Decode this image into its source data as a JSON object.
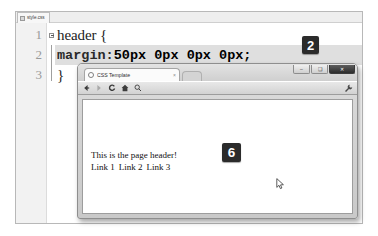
{
  "editor": {
    "tab": {
      "label": "style.css",
      "icon": "document-icon"
    },
    "gutter_line_numbers": [
      "1",
      "2",
      "3"
    ],
    "code": {
      "line1": "header {",
      "line2_property": "margin:",
      "line2_value": "50px 0px 0px 0px;",
      "line3": "}"
    }
  },
  "callouts": [
    {
      "id": "badge-2",
      "label": "2"
    },
    {
      "id": "badge-6",
      "label": "6"
    }
  ],
  "browser": {
    "tab": {
      "title": "CSS Template",
      "favicon": "globe-icon",
      "close": "×"
    },
    "new_tab_label": "",
    "window_controls": {
      "minimize": "–",
      "maximize": "❑",
      "close": "✕"
    },
    "toolbar": {
      "back": "back-arrow-icon",
      "forward": "forward-arrow-icon",
      "reload": "C",
      "home": "home-icon",
      "search": "search-icon",
      "menu": "wrench-icon"
    },
    "page": {
      "header_text": "This is the page header!",
      "links": [
        "Link 1",
        "Link 2",
        "Link 3"
      ]
    }
  },
  "colors": {
    "badge_bg": "#2b2b2b",
    "badge_fg": "#ffffff",
    "editor_bg": "#ffffff",
    "gutter_bg": "#f2f2f2",
    "selection_bg": "#dfdfdf",
    "chrome_bg": "#d2d2d2"
  }
}
